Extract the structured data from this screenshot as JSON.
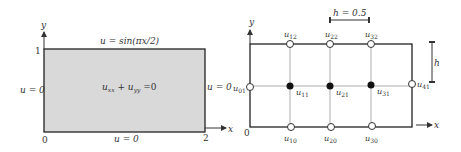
{
  "left_panel": {
    "axis_x_label": "x",
    "axis_y_label": "y",
    "tick_y_top": "1",
    "tick_origin": "0",
    "tick_x_right": "2",
    "bc_top": "u = sin(πx/2)",
    "bc_left": "u = 0",
    "bc_right": "u = 0",
    "bc_bottom": "u = 0",
    "equation_main_1": "u",
    "equation_sub_1": "xx",
    "equation_plus": " + ",
    "equation_main_2": "u",
    "equation_sub_2": "yy",
    "equation_rhs": " =0",
    "fill_color": "#d9d9d9"
  },
  "right_panel": {
    "axis_x_label": "x",
    "axis_y_label": "y",
    "tick_origin": "0",
    "spacing_label": "h = 0.5",
    "vertical_spacing_label": "h",
    "nodes_top": [
      {
        "main": "u",
        "sub": "12"
      },
      {
        "main": "u",
        "sub": "22"
      },
      {
        "main": "u",
        "sub": "32"
      }
    ],
    "nodes_middle_interior": [
      {
        "main": "u",
        "sub": "11"
      },
      {
        "main": "u",
        "sub": "21"
      },
      {
        "main": "u",
        "sub": "31"
      }
    ],
    "node_left": {
      "main": "u",
      "sub": "01"
    },
    "node_right": {
      "main": "u",
      "sub": "41"
    },
    "nodes_bottom": [
      {
        "main": "u",
        "sub": "10"
      },
      {
        "main": "u",
        "sub": "20"
      },
      {
        "main": "u",
        "sub": "30"
      }
    ]
  }
}
